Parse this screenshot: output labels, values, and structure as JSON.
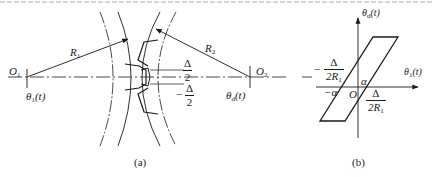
{
  "figure": {
    "panel_a": {
      "caption": "(a)",
      "labels": {
        "o1": "O",
        "o1_sub": "1",
        "o2": "O",
        "o2_sub": "2",
        "r1": "R",
        "r1_sub": "1",
        "r2": "R",
        "r2_sub": "2",
        "theta1": "θ",
        "theta1_sub": "1",
        "theta1_arg": "(t)",
        "theta2": "θ",
        "theta2_sub": "d",
        "theta2_arg": "(t)",
        "backlash_top_num": "Δ",
        "backlash_top_den": "2",
        "backlash_bot_sign": "−",
        "backlash_bot_num": "Δ",
        "backlash_bot_den": "2"
      }
    },
    "panel_b": {
      "caption": "(b)",
      "labels": {
        "y_axis": "θ",
        "y_axis_sub": "d",
        "y_axis_arg": "(t)",
        "x_axis": "θ",
        "x_axis_sub": "1",
        "x_axis_arg": "(t)",
        "origin": "O",
        "alpha_pos": "α",
        "alpha_neg": "−α",
        "left_frac_sign": "−",
        "left_frac_num": "Δ",
        "left_frac_den": "2R",
        "left_frac_den_sub": "1",
        "right_frac_num": "Δ",
        "right_frac_den": "2R",
        "right_frac_den_sub": "1"
      }
    }
  }
}
